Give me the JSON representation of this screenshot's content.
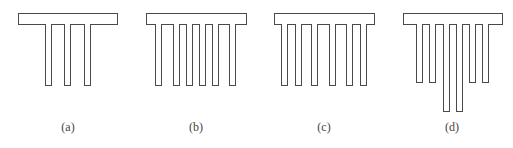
{
  "figure": {
    "panels": [
      {
        "label": "(a)",
        "cap": {
          "x": 18,
          "y": 13,
          "w": 100,
          "h": 12
        },
        "piles": [
          {
            "x": 45,
            "bottom": 86
          },
          {
            "x": 64,
            "bottom": 86
          },
          {
            "x": 84,
            "bottom": 86
          }
        ],
        "label_x": 48
      },
      {
        "label": "(b)",
        "cap": {
          "x": 146,
          "y": 13,
          "w": 101,
          "h": 12
        },
        "piles": [
          {
            "x": 155,
            "bottom": 86
          },
          {
            "x": 173,
            "bottom": 86
          },
          {
            "x": 186,
            "bottom": 86
          },
          {
            "x": 199,
            "bottom": 86
          },
          {
            "x": 212,
            "bottom": 86
          },
          {
            "x": 229,
            "bottom": 86
          }
        ],
        "label_x": 176
      },
      {
        "label": "(c)",
        "cap": {
          "x": 274,
          "y": 13,
          "w": 101,
          "h": 12
        },
        "piles": [
          {
            "x": 281,
            "bottom": 86
          },
          {
            "x": 295,
            "bottom": 86
          },
          {
            "x": 311,
            "bottom": 86
          },
          {
            "x": 329,
            "bottom": 86
          },
          {
            "x": 346,
            "bottom": 86
          },
          {
            "x": 360,
            "bottom": 86
          }
        ],
        "label_x": 304
      },
      {
        "label": "(d)",
        "cap": {
          "x": 403,
          "y": 13,
          "w": 100,
          "h": 12
        },
        "piles": [
          {
            "x": 416,
            "bottom": 83
          },
          {
            "x": 429,
            "bottom": 83
          },
          {
            "x": 443,
            "bottom": 112
          },
          {
            "x": 456,
            "bottom": 112
          },
          {
            "x": 469,
            "bottom": 83
          },
          {
            "x": 482,
            "bottom": 83
          }
        ],
        "label_x": 432
      }
    ],
    "colors": {
      "stroke": "#4a4a4a",
      "fill": "#ffffff",
      "label": "#444444"
    }
  }
}
